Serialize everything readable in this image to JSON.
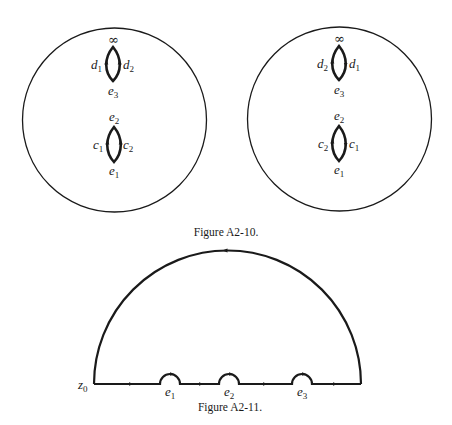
{
  "figure_a2_10": {
    "caption": "Figure A2-10.",
    "left_sphere": {
      "top_lens": {
        "top_label": "∞",
        "left_label": "d",
        "left_sub": "1",
        "right_label": "d",
        "right_sub": "2",
        "bottom_label": "e",
        "bottom_sub": "3"
      },
      "bottom_lens": {
        "top_label": "e",
        "top_sub": "2",
        "left_label": "c",
        "left_sub": "1",
        "right_label": "c",
        "right_sub": "2",
        "bottom_label": "e",
        "bottom_sub": "1"
      }
    },
    "right_sphere": {
      "top_lens": {
        "top_label": "∞",
        "left_label": "d",
        "left_sub": "2",
        "right_label": "d",
        "right_sub": "1",
        "bottom_label": "e",
        "bottom_sub": "3"
      },
      "bottom_lens": {
        "top_label": "e",
        "top_sub": "2",
        "left_label": "c",
        "left_sub": "2",
        "right_label": "c",
        "right_sub": "1",
        "bottom_label": "e",
        "bottom_sub": "1"
      }
    }
  },
  "figure_a2_11": {
    "caption": "Figure A2-11.",
    "start_label": "z",
    "start_sub": "0",
    "points": [
      {
        "label": "e",
        "sub": "1"
      },
      {
        "label": "e",
        "sub": "2"
      },
      {
        "label": "e",
        "sub": "3"
      }
    ]
  },
  "colors": {
    "ink": "#1a1a1a",
    "background": "#ffffff"
  }
}
